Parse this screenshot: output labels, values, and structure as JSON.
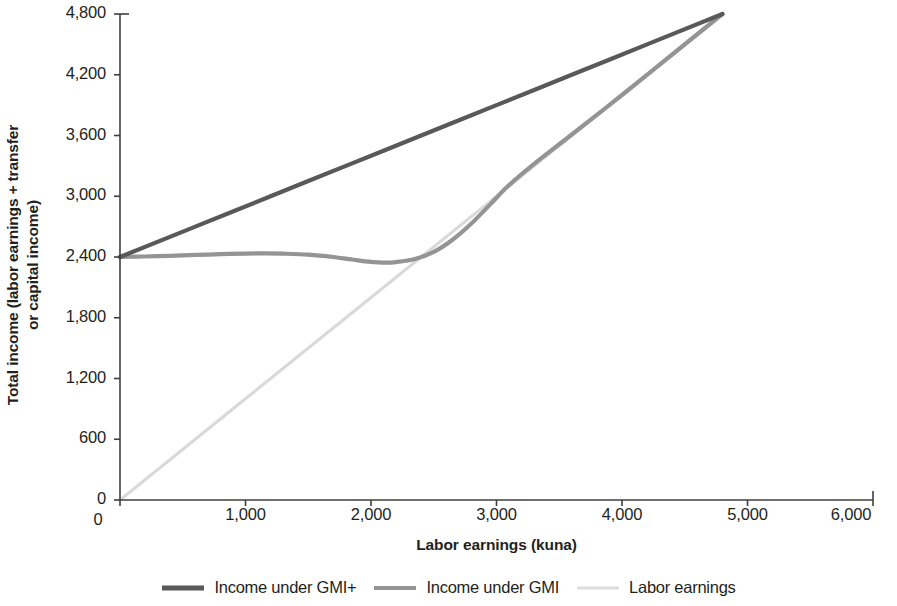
{
  "chart_data": {
    "type": "line",
    "title": "",
    "xlabel": "Labor earnings (kuna)",
    "ylabel_line1": "Total income (labor earnings + transfer",
    "ylabel_line2": "or capital income)",
    "xlim": [
      0,
      6000
    ],
    "ylim": [
      0,
      4800
    ],
    "xticks": [
      0,
      1000,
      2000,
      3000,
      4000,
      5000,
      6000
    ],
    "xtick_labels": [
      "0",
      "1,000",
      "2,000",
      "3,000",
      "4,000",
      "5,000",
      "6,000"
    ],
    "yticks": [
      0,
      600,
      1200,
      1800,
      2400,
      3000,
      3600,
      4200,
      4800
    ],
    "ytick_labels": [
      "0",
      "600",
      "1,200",
      "1,800",
      "2,400",
      "3,000",
      "3,600",
      "4,200",
      "4,800"
    ],
    "grid": false,
    "legend_position": "bottom-center",
    "series": [
      {
        "name": "Income under GMI+",
        "color": "#595959",
        "width": 4.2,
        "points": [
          [
            0,
            2400
          ],
          [
            600,
            2700
          ],
          [
            1200,
            3000
          ],
          [
            1800,
            3300
          ],
          [
            2400,
            3600
          ],
          [
            3000,
            3900
          ],
          [
            3600,
            4200
          ],
          [
            4200,
            4500
          ],
          [
            4800,
            4800
          ]
        ]
      },
      {
        "name": "Income under GMI",
        "color": "#949494",
        "width": 4.2,
        "points": [
          [
            0,
            2400
          ],
          [
            200,
            2405
          ],
          [
            400,
            2412
          ],
          [
            600,
            2420
          ],
          [
            800,
            2428
          ],
          [
            1000,
            2434
          ],
          [
            1150,
            2436
          ],
          [
            1300,
            2433
          ],
          [
            1500,
            2423
          ],
          [
            1700,
            2400
          ],
          [
            1850,
            2375
          ],
          [
            2000,
            2352
          ],
          [
            2100,
            2345
          ],
          [
            2200,
            2350
          ],
          [
            2350,
            2380
          ],
          [
            2500,
            2450
          ],
          [
            2650,
            2570
          ],
          [
            2800,
            2730
          ],
          [
            2950,
            2920
          ],
          [
            3100,
            3110
          ],
          [
            3300,
            3320
          ],
          [
            3600,
            3610
          ],
          [
            4000,
            4000
          ],
          [
            4400,
            4400
          ],
          [
            4800,
            4800
          ]
        ]
      },
      {
        "name": "Labor earnings",
        "color": "#d9d9d9",
        "width": 3.0,
        "points": [
          [
            0,
            0
          ],
          [
            1200,
            1200
          ],
          [
            2400,
            2400
          ],
          [
            3600,
            3600
          ],
          [
            4800,
            4800
          ]
        ]
      }
    ],
    "annotations": []
  },
  "legend": {
    "items": [
      {
        "label": "Income under GMI+",
        "color": "#595959",
        "thickness": 5
      },
      {
        "label": "Income under GMI",
        "color": "#949494",
        "thickness": 4
      },
      {
        "label": "Labor earnings",
        "color": "#dcdcdc",
        "thickness": 3
      }
    ]
  },
  "axes": {
    "color": "#3f3f3f",
    "tick_length": 6
  }
}
